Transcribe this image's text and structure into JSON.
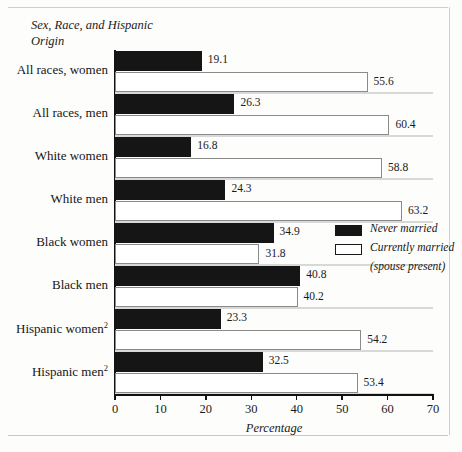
{
  "figure": {
    "y_axis_title": "Sex, Race, and Hispanic Origin",
    "x_axis_label": "Percentage"
  },
  "legend": {
    "items": [
      {
        "label": "Never married",
        "swatch": "black-swatch-icon",
        "color": "#151515"
      },
      {
        "label": "Currently married",
        "label2": "(spouse present)",
        "swatch": "white-swatch-icon",
        "color": "#ffffff"
      }
    ]
  },
  "chart_data": {
    "type": "bar",
    "orientation": "horizontal",
    "title": "",
    "xlabel": "Percentage",
    "ylabel": "Sex, Race, and Hispanic Origin",
    "xlim": [
      0,
      70
    ],
    "xticks": [
      0,
      10,
      20,
      30,
      40,
      50,
      60,
      70
    ],
    "grid": false,
    "legend_position": "right-middle",
    "categories": [
      "All races, women",
      "All races, men",
      "White women",
      "White men",
      "Black women",
      "Black men",
      "Hispanic women",
      "Hispanic men"
    ],
    "category_footnotes": [
      "",
      "",
      "",
      "",
      "",
      "",
      "2",
      "2"
    ],
    "series": [
      {
        "name": "Never married",
        "color": "#151515",
        "values": [
          19.1,
          26.3,
          16.8,
          24.3,
          34.9,
          40.8,
          23.3,
          32.5
        ]
      },
      {
        "name": "Currently married (spouse present)",
        "color": "#ffffff",
        "values": [
          55.6,
          60.4,
          58.8,
          63.2,
          31.8,
          40.2,
          54.2,
          53.4
        ]
      }
    ]
  }
}
